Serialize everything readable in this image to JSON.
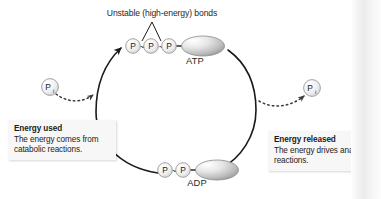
{
  "figure": {
    "title_annotation": "Unstable (high-energy) bonds",
    "molecules": {
      "atp": {
        "label": "ATP",
        "phosphates": [
          "P",
          "P",
          "P"
        ],
        "bonds": [
          "~",
          "~"
        ]
      },
      "adp": {
        "label": "ADP",
        "phosphates": [
          "P",
          "P"
        ],
        "bonds": [
          "~"
        ]
      }
    },
    "free_phosphates": {
      "left": {
        "label": "P",
        "subscript": "i"
      },
      "right": {
        "label": "P",
        "subscript": "i"
      }
    },
    "callouts": {
      "left": {
        "title": "Energy used",
        "body": "The energy comes from catabolic reactions."
      },
      "right": {
        "title": "Energy released",
        "body": "The energy drives anabolic reactions."
      }
    },
    "colors": {
      "stroke": "#1a1a1a",
      "callout_bg": "#f7f7f7",
      "adenosine_fill_light": "#ffffff",
      "adenosine_fill_dark": "#9a9a9a",
      "phosphate_fill": "#f2f2f2",
      "background": "#ffffff"
    }
  }
}
